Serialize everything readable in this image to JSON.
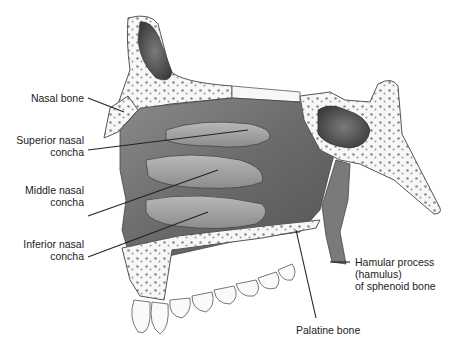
{
  "figure": {
    "labels": [
      {
        "id": "nasal-bone",
        "lines": [
          "Nasal bone"
        ]
      },
      {
        "id": "superior-nasal-concha",
        "lines": [
          "Superior nasal",
          "concha"
        ]
      },
      {
        "id": "middle-nasal-concha",
        "lines": [
          "Middle nasal",
          "concha"
        ]
      },
      {
        "id": "inferior-nasal-concha",
        "lines": [
          "Inferior nasal",
          "concha"
        ]
      },
      {
        "id": "hamular-process",
        "lines": [
          "Hamular process",
          "(hamulus)",
          "of sphenoid bone"
        ]
      },
      {
        "id": "palatine-bone",
        "lines": [
          "Palatine bone"
        ]
      }
    ]
  },
  "colors": {
    "bone_fill": "#f7f7f7",
    "outline": "#555555",
    "mucosa_dark": "#6e6e6e",
    "mucosa_mid": "#9a9a9a",
    "mucosa_light": "#c8c8c8",
    "leader": "#222222",
    "text": "#222222"
  }
}
